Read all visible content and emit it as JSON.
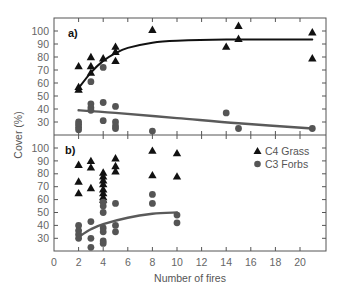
{
  "chart_data": [
    {
      "type": "scatter",
      "panel_label": "a)",
      "xlabel": "Number of fires",
      "ylabel": "Cover (%)",
      "xlim": [
        0,
        22
      ],
      "ylim": [
        23,
        103
      ],
      "yticks": [
        30,
        40,
        50,
        60,
        70,
        80,
        90,
        100
      ],
      "series": [
        {
          "name": "C4 Grass",
          "marker": "triangle",
          "color": "#111111",
          "points": [
            [
              2,
              73
            ],
            [
              2,
              57
            ],
            [
              2,
              55
            ],
            [
              3,
              80
            ],
            [
              3,
              73
            ],
            [
              3,
              68
            ],
            [
              4,
              79
            ],
            [
              5,
              88
            ],
            [
              5,
              84
            ],
            [
              5,
              77
            ],
            [
              8,
              101
            ],
            [
              14,
              88
            ],
            [
              15,
              104
            ],
            [
              15,
              94
            ],
            [
              21,
              99
            ],
            [
              21,
              79
            ]
          ],
          "fit": [
            [
              2,
              56
            ],
            [
              3,
              68
            ],
            [
              4,
              77
            ],
            [
              5,
              83
            ],
            [
              6,
              87
            ],
            [
              8,
              91
            ],
            [
              10,
              92.5
            ],
            [
              14,
              93.5
            ],
            [
              21,
              93.5
            ]
          ]
        },
        {
          "name": "C3 Forbs",
          "marker": "circle",
          "color": "#555555",
          "points": [
            [
              2,
              30
            ],
            [
              2,
              28
            ],
            [
              2,
              26
            ],
            [
              2,
              24
            ],
            [
              3,
              61
            ],
            [
              3,
              44
            ],
            [
              3,
              41
            ],
            [
              3,
              39
            ],
            [
              4,
              72
            ],
            [
              4,
              45
            ],
            [
              4,
              31
            ],
            [
              5,
              42
            ],
            [
              5,
              30
            ],
            [
              5,
              27
            ],
            [
              5,
              25
            ],
            [
              8,
              23
            ],
            [
              14,
              37
            ],
            [
              15,
              25
            ],
            [
              21,
              25
            ]
          ],
          "fit": [
            [
              2,
              39
            ],
            [
              5,
              37
            ],
            [
              10,
              33
            ],
            [
              15,
              29
            ],
            [
              21,
              25
            ]
          ]
        }
      ]
    },
    {
      "type": "scatter",
      "panel_label": "b)",
      "xlabel": "Number of fires",
      "ylabel": "Cover (%)",
      "xlim": [
        0,
        22
      ],
      "ylim": [
        20,
        103
      ],
      "yticks": [
        30,
        40,
        50,
        60,
        70,
        80,
        90,
        100
      ],
      "xticks": [
        0,
        2,
        4,
        6,
        8,
        10,
        12,
        14,
        16,
        18,
        20
      ],
      "series": [
        {
          "name": "C4 Grass",
          "marker": "triangle",
          "color": "#111111",
          "points": [
            [
              2,
              87
            ],
            [
              2,
              74
            ],
            [
              2,
              65
            ],
            [
              3,
              90
            ],
            [
              3,
              85
            ],
            [
              3,
              69
            ],
            [
              4,
              81
            ],
            [
              4,
              78
            ],
            [
              4,
              75
            ],
            [
              4,
              72
            ],
            [
              4,
              68
            ],
            [
              4,
              65
            ],
            [
              4,
              62
            ],
            [
              4,
              60
            ],
            [
              5,
              92
            ],
            [
              5,
              86
            ],
            [
              5,
              82
            ],
            [
              8,
              98
            ],
            [
              8,
              79
            ],
            [
              10,
              96
            ],
            [
              10,
              78
            ]
          ]
        },
        {
          "name": "C3 Forbs",
          "marker": "circle",
          "color": "#555555",
          "points": [
            [
              2,
              40
            ],
            [
              2,
              36
            ],
            [
              2,
              33
            ],
            [
              2,
              30
            ],
            [
              3,
              43
            ],
            [
              3,
              30
            ],
            [
              3,
              23
            ],
            [
              4,
              58
            ],
            [
              4,
              55
            ],
            [
              4,
              50
            ],
            [
              4,
              38
            ],
            [
              4,
              35
            ],
            [
              4,
              28
            ],
            [
              4,
              26
            ],
            [
              5,
              57
            ],
            [
              5,
              40
            ],
            [
              5,
              35
            ],
            [
              8,
              64
            ],
            [
              8,
              57
            ],
            [
              10,
              48
            ],
            [
              10,
              42
            ]
          ],
          "fit": [
            [
              2,
              31
            ],
            [
              3,
              37
            ],
            [
              4,
              41
            ],
            [
              6,
              46
            ],
            [
              8,
              49
            ],
            [
              10,
              50
            ]
          ]
        }
      ]
    }
  ],
  "axes": {
    "ylabel": "Cover (%)",
    "xlabel": "Number of fires",
    "x_tick_labels": [
      "0",
      "2",
      "4",
      "6",
      "8",
      "10",
      "12",
      "14",
      "16",
      "18",
      "20"
    ],
    "top_y_tick_labels": [
      "100",
      "90",
      "80",
      "70",
      "60",
      "50",
      "40",
      "30"
    ],
    "bottom_y_tick_labels": [
      "100",
      "90",
      "80",
      "70",
      "60",
      "50",
      "40",
      "30"
    ]
  },
  "panels": {
    "top_label": "a)",
    "bottom_label": "b)"
  },
  "legend": {
    "items": [
      {
        "label": "C4 Grass",
        "marker": "triangle"
      },
      {
        "label": "C3 Forbs",
        "marker": "circle"
      }
    ]
  },
  "colors": {
    "grass": "#111111",
    "forbs": "#555555",
    "grass_fit": "#111111",
    "forbs_fit": "#5a5a5a",
    "axis": "#444444"
  }
}
